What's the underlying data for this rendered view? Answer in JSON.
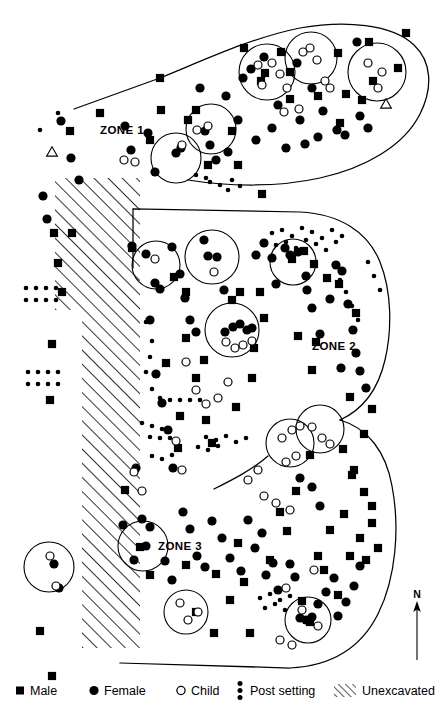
{
  "zones": [
    {
      "id": "zone-1",
      "label": "ZONE 1",
      "x": 100,
      "y": 134
    },
    {
      "id": "zone-2",
      "label": "ZONE 2",
      "x": 312,
      "y": 350
    },
    {
      "id": "zone-3",
      "label": "ZONE 3",
      "x": 158,
      "y": 550
    }
  ],
  "compass": {
    "label": "N",
    "x": 417,
    "y": 598
  },
  "legend": {
    "items": [
      {
        "key": "male",
        "label": "Male",
        "symbol": "filled-square",
        "x": 22,
        "y": 691
      },
      {
        "key": "female",
        "label": "Female",
        "symbol": "filled-circle",
        "x": 96,
        "y": 691
      },
      {
        "key": "child",
        "label": "Child",
        "symbol": "open-circle",
        "x": 183,
        "y": 691
      },
      {
        "key": "post_setting",
        "label": "Post setting",
        "symbol": "dot-column",
        "x": 242,
        "y": 691
      },
      {
        "key": "unexcavated",
        "label": "Unexcavated",
        "symbol": "diagonal-hatch",
        "x": 344,
        "y": 691
      }
    ]
  },
  "colors": {
    "ink": "#000000",
    "paper": "#ffffff"
  },
  "chart_data": {
    "type": "scatter",
    "xlabel": "",
    "ylabel": "",
    "xlim": [
      0,
      441
    ],
    "ylim": [
      0,
      714
    ],
    "grid": false,
    "legend_position": "bottom",
    "series": [
      {
        "name": "Male",
        "marker": "filled-square",
        "count": 96
      },
      {
        "name": "Female",
        "marker": "filled-circle",
        "count": 118
      },
      {
        "name": "Child",
        "marker": "open-circle",
        "count": 42
      },
      {
        "name": "Post setting",
        "marker": "small-dot",
        "count": 112
      }
    ],
    "zone_boundaries": [
      {
        "zone": "ZONE 1",
        "path": "M 74 109 L 160 78 C 200 62 250 38 300 28 C 345 20 392 24 414 45 C 432 62 433 88 420 114 C 404 146 365 168 320 178 C 275 188 225 186 188 180"
      },
      {
        "zone": "ZONE 2",
        "path": "M 133 209 L 300 212 C 340 214 368 232 380 262 C 392 292 392 330 385 360 C 378 390 362 410 340 420"
      },
      {
        "zone": "ZONE 3",
        "path": "M 340 420 C 368 428 386 452 392 486 C 400 528 396 578 378 614 C 360 650 330 666 290 668 L 120 663"
      },
      {
        "zone": "ZONE 2-3 internal",
        "path": "M 214 489 C 232 480 252 470 268 456"
      },
      {
        "zone": "west edge",
        "path": "M 133 209 L 133 268"
      }
    ],
    "unexcavated_polygon": [
      [
        55,
        178
      ],
      [
        140,
        178
      ],
      [
        140,
        648
      ],
      [
        82,
        648
      ],
      [
        82,
        310
      ],
      [
        55,
        310
      ]
    ],
    "cluster_circles": [
      {
        "cx": 176,
        "cy": 158,
        "r": 25
      },
      {
        "cx": 211,
        "cy": 129,
        "r": 25
      },
      {
        "cx": 267,
        "cy": 72,
        "r": 28
      },
      {
        "cx": 311,
        "cy": 58,
        "r": 26
      },
      {
        "cx": 377,
        "cy": 72,
        "r": 29
      },
      {
        "cx": 156,
        "cy": 265,
        "r": 24
      },
      {
        "cx": 212,
        "cy": 257,
        "r": 27
      },
      {
        "cx": 293,
        "cy": 262,
        "r": 23
      },
      {
        "cx": 232,
        "cy": 330,
        "r": 27
      },
      {
        "cx": 290,
        "cy": 443,
        "r": 24
      },
      {
        "cx": 320,
        "cy": 429,
        "r": 24
      },
      {
        "cx": 143,
        "cy": 546,
        "r": 25
      },
      {
        "cx": 49,
        "cy": 567,
        "r": 25
      },
      {
        "cx": 186,
        "cy": 612,
        "r": 22
      },
      {
        "cx": 308,
        "cy": 620,
        "r": 23
      }
    ],
    "triangles": [
      {
        "x": 52,
        "y": 152
      },
      {
        "x": 386,
        "y": 104
      }
    ],
    "males": [
      [
        70,
        131
      ],
      [
        160,
        78
      ],
      [
        161,
        110
      ],
      [
        188,
        120
      ],
      [
        244,
        48
      ],
      [
        261,
        81
      ],
      [
        265,
        73
      ],
      [
        281,
        52
      ],
      [
        290,
        72
      ],
      [
        318,
        96
      ],
      [
        338,
        53
      ],
      [
        340,
        123
      ],
      [
        346,
        94
      ],
      [
        373,
        81
      ],
      [
        369,
        42
      ],
      [
        398,
        68
      ],
      [
        406,
        33
      ],
      [
        362,
        100
      ],
      [
        290,
        99
      ],
      [
        232,
        131
      ],
      [
        196,
        110
      ],
      [
        150,
        140
      ],
      [
        100,
        113
      ],
      [
        52,
        676
      ],
      [
        186,
        338
      ],
      [
        196,
        378
      ],
      [
        166,
        363
      ],
      [
        204,
        360
      ],
      [
        236,
        407
      ],
      [
        252,
        378
      ],
      [
        260,
        292
      ],
      [
        292,
        259
      ],
      [
        304,
        251
      ],
      [
        314,
        264
      ],
      [
        327,
        278
      ],
      [
        339,
        284
      ],
      [
        316,
        342
      ],
      [
        312,
        370
      ],
      [
        356,
        313
      ],
      [
        350,
        397
      ],
      [
        372,
        409
      ],
      [
        364,
        434
      ],
      [
        343,
        449
      ],
      [
        310,
        455
      ],
      [
        352,
        475
      ],
      [
        364,
        492
      ],
      [
        372,
        506
      ],
      [
        180,
        416
      ],
      [
        178,
        448
      ],
      [
        206,
        420
      ],
      [
        212,
        443
      ],
      [
        54,
        233
      ],
      [
        72,
        233
      ],
      [
        58,
        263
      ],
      [
        62,
        292
      ],
      [
        52,
        344
      ],
      [
        50,
        400
      ],
      [
        40,
        631
      ],
      [
        125,
        490
      ],
      [
        140,
        547
      ],
      [
        150,
        575
      ],
      [
        186,
        565
      ],
      [
        196,
        612
      ],
      [
        214,
        633
      ],
      [
        216,
        574
      ],
      [
        230,
        600
      ],
      [
        238,
        543
      ],
      [
        244,
        582
      ],
      [
        250,
        633
      ],
      [
        270,
        560
      ],
      [
        280,
        512
      ],
      [
        287,
        531
      ],
      [
        296,
        491
      ],
      [
        302,
        601
      ],
      [
        310,
        622
      ],
      [
        318,
        556
      ],
      [
        324,
        570
      ],
      [
        330,
        530
      ],
      [
        338,
        595
      ],
      [
        344,
        514
      ],
      [
        350,
        556
      ],
      [
        354,
        470
      ],
      [
        360,
        538
      ],
      [
        366,
        560
      ],
      [
        372,
        523
      ],
      [
        378,
        548
      ],
      [
        298,
        336
      ],
      [
        264,
        318
      ],
      [
        254,
        348
      ],
      [
        240,
        292
      ],
      [
        232,
        300
      ],
      [
        186,
        292
      ],
      [
        174,
        277
      ],
      [
        132,
        248
      ],
      [
        262,
        194
      ],
      [
        238,
        165
      ],
      [
        208,
        165
      ]
    ],
    "females": [
      [
        61,
        121
      ],
      [
        71,
        158
      ],
      [
        79,
        180
      ],
      [
        125,
        126
      ],
      [
        131,
        150
      ],
      [
        148,
        133
      ],
      [
        155,
        172
      ],
      [
        176,
        153
      ],
      [
        181,
        148
      ],
      [
        200,
        88
      ],
      [
        205,
        131
      ],
      [
        210,
        145
      ],
      [
        216,
        160
      ],
      [
        226,
        96
      ],
      [
        228,
        152
      ],
      [
        238,
        120
      ],
      [
        243,
        78
      ],
      [
        251,
        69
      ],
      [
        256,
        140
      ],
      [
        264,
        57
      ],
      [
        272,
        128
      ],
      [
        278,
        105
      ],
      [
        286,
        148
      ],
      [
        297,
        63
      ],
      [
        300,
        120
      ],
      [
        305,
        144
      ],
      [
        312,
        88
      ],
      [
        318,
        137
      ],
      [
        323,
        111
      ],
      [
        337,
        130
      ],
      [
        345,
        135
      ],
      [
        357,
        42
      ],
      [
        360,
        116
      ],
      [
        368,
        128
      ],
      [
        132,
        246
      ],
      [
        146,
        254
      ],
      [
        155,
        283
      ],
      [
        160,
        289
      ],
      [
        172,
        247
      ],
      [
        180,
        274
      ],
      [
        185,
        298
      ],
      [
        190,
        320
      ],
      [
        196,
        332
      ],
      [
        204,
        240
      ],
      [
        208,
        256
      ],
      [
        217,
        257
      ],
      [
        224,
        290
      ],
      [
        225,
        332
      ],
      [
        233,
        327
      ],
      [
        240,
        324
      ],
      [
        247,
        330
      ],
      [
        252,
        328
      ],
      [
        256,
        255
      ],
      [
        264,
        243
      ],
      [
        272,
        258
      ],
      [
        276,
        284
      ],
      [
        285,
        248
      ],
      [
        290,
        255
      ],
      [
        298,
        252
      ],
      [
        306,
        276
      ],
      [
        307,
        290
      ],
      [
        312,
        308
      ],
      [
        320,
        334
      ],
      [
        330,
        299
      ],
      [
        336,
        265
      ],
      [
        342,
        271
      ],
      [
        348,
        304
      ],
      [
        353,
        330
      ],
      [
        356,
        353
      ],
      [
        341,
        368
      ],
      [
        360,
        371
      ],
      [
        366,
        388
      ],
      [
        150,
        320
      ],
      [
        156,
        374
      ],
      [
        162,
        403
      ],
      [
        168,
        430
      ],
      [
        173,
        468
      ],
      [
        136,
        468
      ],
      [
        142,
        519
      ],
      [
        150,
        527
      ],
      [
        43,
        196
      ],
      [
        47,
        219
      ],
      [
        54,
        564
      ],
      [
        59,
        588
      ],
      [
        123,
        525
      ],
      [
        134,
        560
      ],
      [
        146,
        546
      ],
      [
        165,
        561
      ],
      [
        172,
        580
      ],
      [
        183,
        512
      ],
      [
        190,
        529
      ],
      [
        197,
        556
      ],
      [
        205,
        567
      ],
      [
        212,
        521
      ],
      [
        222,
        538
      ],
      [
        230,
        558
      ],
      [
        241,
        571
      ],
      [
        248,
        520
      ],
      [
        255,
        548
      ],
      [
        262,
        533
      ],
      [
        266,
        575
      ],
      [
        273,
        563
      ],
      [
        278,
        590
      ],
      [
        290,
        564
      ],
      [
        295,
        577
      ],
      [
        300,
        618
      ],
      [
        306,
        620
      ],
      [
        312,
        617
      ],
      [
        318,
        604
      ],
      [
        326,
        592
      ],
      [
        334,
        578
      ],
      [
        338,
        616
      ],
      [
        346,
        602
      ],
      [
        354,
        586
      ],
      [
        360,
        566
      ],
      [
        312,
        487
      ],
      [
        320,
        506
      ],
      [
        300,
        478
      ]
    ],
    "children": [
      [
        124,
        160
      ],
      [
        135,
        162
      ],
      [
        182,
        145
      ],
      [
        197,
        130
      ],
      [
        208,
        126
      ],
      [
        258,
        65
      ],
      [
        262,
        85
      ],
      [
        272,
        63
      ],
      [
        280,
        74
      ],
      [
        287,
        88
      ],
      [
        303,
        52
      ],
      [
        310,
        48
      ],
      [
        317,
        60
      ],
      [
        325,
        81
      ],
      [
        330,
        88
      ],
      [
        368,
        63
      ],
      [
        378,
        88
      ],
      [
        382,
        72
      ],
      [
        299,
        109
      ],
      [
        284,
        112
      ],
      [
        155,
        259
      ],
      [
        214,
        272
      ],
      [
        226,
        342
      ],
      [
        235,
        348
      ],
      [
        243,
        345
      ],
      [
        252,
        341
      ],
      [
        186,
        362
      ],
      [
        196,
        390
      ],
      [
        206,
        404
      ],
      [
        218,
        398
      ],
      [
        228,
        382
      ],
      [
        176,
        441
      ],
      [
        182,
        470
      ],
      [
        134,
        472
      ],
      [
        142,
        491
      ],
      [
        282,
        438
      ],
      [
        292,
        430
      ],
      [
        300,
        426
      ],
      [
        312,
        427
      ],
      [
        322,
        438
      ],
      [
        330,
        444
      ],
      [
        296,
        456
      ],
      [
        286,
        462
      ],
      [
        180,
        603
      ],
      [
        188,
        620
      ],
      [
        198,
        612
      ],
      [
        302,
        610
      ],
      [
        318,
        626
      ],
      [
        286,
        588
      ],
      [
        264,
        496
      ],
      [
        276,
        503
      ],
      [
        290,
        510
      ],
      [
        248,
        480
      ],
      [
        258,
        470
      ],
      [
        314,
        570
      ],
      [
        56,
        586
      ],
      [
        50,
        556
      ],
      [
        280,
        640
      ],
      [
        292,
        645
      ]
    ],
    "post_settings": [
      [
        40,
        130
      ],
      [
        58,
        113
      ],
      [
        26,
        288
      ],
      [
        36,
        288
      ],
      [
        46,
        288
      ],
      [
        56,
        288
      ],
      [
        26,
        300
      ],
      [
        36,
        300
      ],
      [
        46,
        300
      ],
      [
        56,
        300
      ],
      [
        28,
        372
      ],
      [
        38,
        372
      ],
      [
        48,
        372
      ],
      [
        58,
        372
      ],
      [
        28,
        384
      ],
      [
        38,
        384
      ],
      [
        48,
        384
      ],
      [
        58,
        384
      ],
      [
        146,
        322
      ],
      [
        152,
        341
      ],
      [
        150,
        357
      ],
      [
        146,
        372
      ],
      [
        152,
        389
      ],
      [
        160,
        398
      ],
      [
        170,
        400
      ],
      [
        180,
        400
      ],
      [
        190,
        400
      ],
      [
        200,
        400
      ],
      [
        142,
        423
      ],
      [
        152,
        426
      ],
      [
        162,
        429
      ],
      [
        150,
        437
      ],
      [
        160,
        438
      ],
      [
        170,
        438
      ],
      [
        210,
        182
      ],
      [
        220,
        185
      ],
      [
        232,
        180
      ],
      [
        240,
        186
      ],
      [
        228,
        190
      ],
      [
        196,
        175
      ],
      [
        206,
        178
      ],
      [
        272,
        233
      ],
      [
        282,
        230
      ],
      [
        292,
        236
      ],
      [
        302,
        228
      ],
      [
        312,
        232
      ],
      [
        322,
        238
      ],
      [
        332,
        230
      ],
      [
        342,
        236
      ],
      [
        276,
        245
      ],
      [
        286,
        242
      ],
      [
        296,
        248
      ],
      [
        306,
        240
      ],
      [
        316,
        244
      ],
      [
        326,
        250
      ],
      [
        336,
        242
      ],
      [
        206,
        437
      ],
      [
        216,
        440
      ],
      [
        226,
        436
      ],
      [
        236,
        442
      ],
      [
        246,
        438
      ],
      [
        198,
        447
      ],
      [
        208,
        450
      ],
      [
        218,
        446
      ],
      [
        260,
        598
      ],
      [
        270,
        594
      ],
      [
        280,
        600
      ],
      [
        290,
        596
      ],
      [
        300,
        602
      ],
      [
        265,
        608
      ],
      [
        275,
        604
      ],
      [
        285,
        610
      ],
      [
        334,
        264
      ],
      [
        340,
        280
      ],
      [
        346,
        292
      ],
      [
        352,
        306
      ],
      [
        358,
        320
      ],
      [
        368,
        262
      ],
      [
        374,
        276
      ],
      [
        380,
        290
      ],
      [
        152,
        456
      ],
      [
        162,
        459
      ],
      [
        172,
        455
      ]
    ]
  }
}
